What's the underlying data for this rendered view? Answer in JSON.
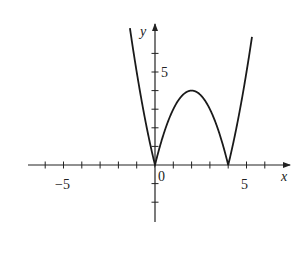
{
  "chart_data": {
    "type": "line",
    "title": "",
    "function": "y = |x^2 - 4x|",
    "xlabel": "x",
    "ylabel": "y",
    "xlim": [
      -7,
      7.5
    ],
    "ylim": [
      -3,
      7.5
    ],
    "x_ticks": [
      -6,
      -5,
      -4,
      -3,
      -2,
      -1,
      1,
      2,
      3,
      4,
      5,
      6
    ],
    "y_ticks": [
      -2,
      -1,
      1,
      2,
      3,
      4,
      5,
      6
    ],
    "x_tick_labels": [
      {
        "value": -5,
        "label": "−5"
      },
      {
        "value": 5,
        "label": "5"
      }
    ],
    "y_tick_labels": [
      {
        "value": 5,
        "label": "5"
      }
    ],
    "origin_label": "0",
    "grid": false,
    "series": [
      {
        "name": "|x^2-4x|",
        "x": [
          -1.37,
          -1,
          0,
          1,
          2,
          3,
          4,
          5,
          5.3
        ],
        "values": [
          7.35,
          5,
          0,
          3,
          4,
          3,
          0,
          5,
          6.89
        ]
      }
    ],
    "key_points": [
      {
        "x": 0,
        "y": 0,
        "note": "cusp"
      },
      {
        "x": 2,
        "y": 4,
        "note": "local max"
      },
      {
        "x": 4,
        "y": 0,
        "note": "cusp"
      }
    ],
    "colors": {
      "curve": "#1a1a1a",
      "axes": "#222222"
    }
  },
  "labels": {
    "x_axis": "x",
    "y_axis": "y",
    "origin": "0",
    "x_neg5": "−5",
    "x_pos5": "5",
    "y_pos5": "5"
  }
}
